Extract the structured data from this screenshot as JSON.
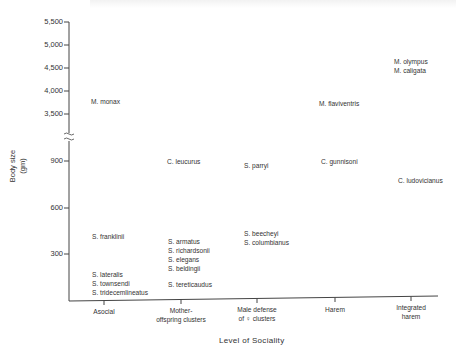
{
  "chart_data": {
    "type": "scatter",
    "title": "",
    "xlabel": "Level of Sociality",
    "ylabel": "Body size (gm)",
    "y_ticks": [
      "5,500",
      "5,000",
      "4,500",
      "4,000",
      "3,500",
      "900",
      "600",
      "300"
    ],
    "y_axis_break": "between 3,500 and 900",
    "categories": [
      "Asocial",
      "Mother-offspring clusters",
      "Male defense of ♀ clusters",
      "Harem",
      "Integrated harem"
    ],
    "points": [
      {
        "label": "M. monax",
        "category": "Asocial",
        "body_size": 3800
      },
      {
        "label": "S. franklinii",
        "category": "Asocial",
        "body_size": 420
      },
      {
        "label": "S. lateralis",
        "category": "Asocial",
        "body_size": 170
      },
      {
        "label": "S. townsendi",
        "category": "Asocial",
        "body_size": 150
      },
      {
        "label": "S. tridecemlineatus",
        "category": "Asocial",
        "body_size": 130
      },
      {
        "label": "C. leucurus",
        "category": "Mother-offspring clusters",
        "body_size": 900
      },
      {
        "label": "S. armatus",
        "category": "Mother-offspring clusters",
        "body_size": 390
      },
      {
        "label": "S. richardsonii",
        "category": "Mother-offspring clusters",
        "body_size": 330
      },
      {
        "label": "S. elegans",
        "category": "Mother-offspring clusters",
        "body_size": 270
      },
      {
        "label": "S. beldingii",
        "category": "Mother-offspring clusters",
        "body_size": 210
      },
      {
        "label": "S. tereticaudus",
        "category": "Mother-offspring clusters",
        "body_size": 120
      },
      {
        "label": "S. parryi",
        "category": "Male defense of ♀ clusters",
        "body_size": 870
      },
      {
        "label": "S. beecheyi",
        "category": "Male defense of ♀ clusters",
        "body_size": 440
      },
      {
        "label": "S. columbianus",
        "category": "Male defense of ♀ clusters",
        "body_size": 380
      },
      {
        "label": "M. flaviventris",
        "category": "Harem",
        "body_size": 3750
      },
      {
        "label": "C. gunnisoni",
        "category": "Harem",
        "body_size": 900
      },
      {
        "label": "M. olympus",
        "category": "Integrated harem",
        "body_size": 4650
      },
      {
        "label": "M. caligata",
        "category": "Integrated harem",
        "body_size": 4500
      },
      {
        "label": "C. ludovicianus",
        "category": "Integrated harem",
        "body_size": 780
      }
    ],
    "grid": false,
    "legend": null
  },
  "axes": {
    "ylabel_line1": "Body size",
    "ylabel_line2": "(gm)",
    "xlabel": "Level of Sociality",
    "y_ticks": [
      {
        "label": "5,500",
        "y": 22
      },
      {
        "label": "5,000",
        "y": 45
      },
      {
        "label": "4,500",
        "y": 68
      },
      {
        "label": "4,000",
        "y": 91
      },
      {
        "label": "3,500",
        "y": 114
      },
      {
        "label": "900",
        "y": 161
      },
      {
        "label": "600",
        "y": 208
      },
      {
        "label": "300",
        "y": 254
      }
    ],
    "categories": [
      {
        "line1": "Asocial",
        "line2": "",
        "x": 104
      },
      {
        "line1": "Mother-",
        "line2": "offspring clusters",
        "x": 181
      },
      {
        "line1": "Male defense",
        "line2": "of ♀ clusters",
        "x": 257
      },
      {
        "line1": "Harem",
        "line2": "",
        "x": 335
      },
      {
        "line1": "Integrated",
        "line2": "harem",
        "x": 411
      }
    ]
  },
  "labels": [
    {
      "text": "M. monax",
      "x": 91,
      "y": 97
    },
    {
      "text": "S. franklinii",
      "x": 92,
      "y": 232
    },
    {
      "text": "S. lateralis",
      "x": 92,
      "y": 270
    },
    {
      "text": "S. townsendi",
      "x": 92,
      "y": 279
    },
    {
      "text": "S. tridecemlineatus",
      "x": 92,
      "y": 288
    },
    {
      "text": "C. leucurus",
      "x": 167,
      "y": 157
    },
    {
      "text": "S. armatus",
      "x": 168,
      "y": 237
    },
    {
      "text": "S. richardsonii",
      "x": 168,
      "y": 246
    },
    {
      "text": "S. elegans",
      "x": 168,
      "y": 255
    },
    {
      "text": "S. beldingii",
      "x": 168,
      "y": 264
    },
    {
      "text": "S. tereticaudus",
      "x": 168,
      "y": 280
    },
    {
      "text": "S.  parryi",
      "x": 244,
      "y": 161
    },
    {
      "text": "S. beecheyi",
      "x": 244,
      "y": 229
    },
    {
      "text": "S. columbianus",
      "x": 244,
      "y": 238
    },
    {
      "text": "M.  flaviventris",
      "x": 319,
      "y": 99
    },
    {
      "text": "C. gunnisoni",
      "x": 321,
      "y": 157
    },
    {
      "text": "M. olympus",
      "x": 394,
      "y": 57
    },
    {
      "text": "M. caligata",
      "x": 394,
      "y": 66
    },
    {
      "text": "C. ludovicianus",
      "x": 398,
      "y": 176
    }
  ]
}
